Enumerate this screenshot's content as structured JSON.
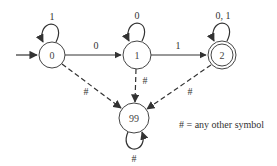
{
  "diagram": {
    "type": "finite-automaton",
    "colors": {
      "stroke": "#333333",
      "text": "#333333",
      "background": "#ffffff"
    },
    "nodes": [
      {
        "id": "0",
        "label": "0",
        "accepting": false,
        "start": true
      },
      {
        "id": "1",
        "label": "1",
        "accepting": false,
        "start": false
      },
      {
        "id": "2",
        "label": "2",
        "accepting": true,
        "start": false
      },
      {
        "id": "99",
        "label": "99",
        "accepting": false,
        "start": false
      }
    ],
    "edges": [
      {
        "from": "0",
        "to": "0",
        "label": "1",
        "style": "solid"
      },
      {
        "from": "0",
        "to": "1",
        "label": "0",
        "style": "solid"
      },
      {
        "from": "1",
        "to": "1",
        "label": "0",
        "style": "solid"
      },
      {
        "from": "1",
        "to": "2",
        "label": "1",
        "style": "solid"
      },
      {
        "from": "2",
        "to": "2",
        "label": "0, 1",
        "style": "solid"
      },
      {
        "from": "0",
        "to": "99",
        "label": "#",
        "style": "dashed"
      },
      {
        "from": "1",
        "to": "99",
        "label": "#",
        "style": "dashed"
      },
      {
        "from": "2",
        "to": "99",
        "label": "#",
        "style": "dashed"
      },
      {
        "from": "99",
        "to": "99",
        "label": "#",
        "style": "solid"
      }
    ],
    "legend": "# = any other symbol"
  }
}
